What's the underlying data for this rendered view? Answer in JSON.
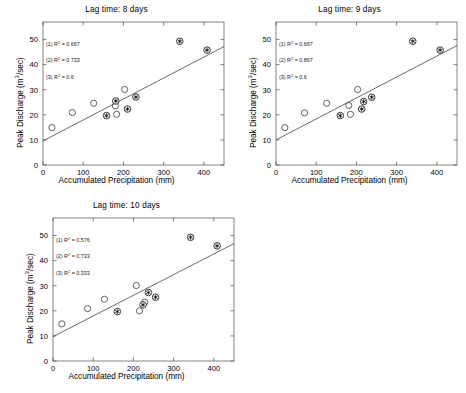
{
  "figure": {
    "panel_count": 3,
    "marker_legend": {
      "open_circle": "open-circle-marker",
      "asterisk_circle": "asterisk-in-circle-marker"
    }
  },
  "chart_data": [
    {
      "type": "scatter",
      "title": "Lag time: 8 days",
      "xlabel": "Accumulated Precipitation (mm)",
      "ylabel": "Peak Discharge (m3/sec)",
      "ylabel_display": "Peak Discharge (m",
      "ylabel_sup": "3",
      "ylabel_tail": "/sec)",
      "xlim": [
        0,
        450
      ],
      "ylim": [
        0,
        57
      ],
      "xticks": [
        0,
        100,
        200,
        300,
        400
      ],
      "yticks": [
        0,
        10,
        20,
        30,
        40,
        50
      ],
      "grid": false,
      "legend_position": "none",
      "annotations": [
        {
          "label": "(1) R",
          "sup": "2",
          "value": " = 0.667"
        },
        {
          "label": "(2) R",
          "sup": "2",
          "value": " = 0.733"
        },
        {
          "label": "(3) R",
          "sup": "2",
          "value": " = 0.6"
        }
      ],
      "fit_line": {
        "x": [
          0,
          450
        ],
        "y": [
          9.6,
          47.2
        ]
      },
      "series": [
        {
          "name": "open-circle",
          "marker": "open_circle",
          "points": [
            [
              22,
              14.9
            ],
            [
              73,
              20.9
            ],
            [
              126,
              24.6
            ],
            [
              180,
              23.6
            ],
            [
              183,
              20.2
            ],
            [
              203,
              30.1
            ]
          ]
        },
        {
          "name": "asterisk-circle",
          "marker": "asterisk_circle",
          "points": [
            [
              158,
              19.7
            ],
            [
              181,
              25.5
            ],
            [
              210,
              22.3
            ],
            [
              231,
              27.1
            ],
            [
              340,
              49.3
            ],
            [
              408,
              45.8
            ]
          ]
        }
      ]
    },
    {
      "type": "scatter",
      "title": "Lag time: 9 days",
      "xlabel": "Accumulated Precipitation (mm)",
      "ylabel": "Peak Discharge (m3/sec)",
      "ylabel_display": "Peak Discharge (m",
      "ylabel_sup": "3",
      "ylabel_tail": "/sec)",
      "xlim": [
        0,
        450
      ],
      "ylim": [
        0,
        57
      ],
      "xticks": [
        0,
        100,
        200,
        300,
        400
      ],
      "yticks": [
        0,
        10,
        20,
        30,
        40,
        50
      ],
      "grid": false,
      "legend_position": "none",
      "annotations": [
        {
          "label": "(1) R",
          "sup": "2",
          "value": " = 0.667"
        },
        {
          "label": "(2) R",
          "sup": "2",
          "value": " = 0.867"
        },
        {
          "label": "(3) R",
          "sup": "2",
          "value": " = 0.6"
        }
      ],
      "fit_line": {
        "x": [
          0,
          450
        ],
        "y": [
          10.0,
          47.6
        ]
      },
      "series": [
        {
          "name": "open-circle",
          "marker": "open_circle",
          "points": [
            [
              22,
              14.9
            ],
            [
              71,
              20.8
            ],
            [
              126,
              24.6
            ],
            [
              181,
              23.7
            ],
            [
              185,
              20.2
            ],
            [
              203,
              30.1
            ]
          ]
        },
        {
          "name": "asterisk-circle",
          "marker": "asterisk_circle",
          "points": [
            [
              160,
              19.7
            ],
            [
              213,
              22.3
            ],
            [
              218,
              25.3
            ],
            [
              238,
              27.0
            ],
            [
              340,
              49.3
            ],
            [
              408,
              45.8
            ]
          ]
        }
      ]
    },
    {
      "type": "scatter",
      "title": "Lag time: 10 days",
      "xlabel": "Accumulated Precipitation (mm)",
      "ylabel": "Peak Discharge (m3/sec)",
      "ylabel_display": "Peak Discharge (m",
      "ylabel_sup": "3",
      "ylabel_tail": "/sec)",
      "xlim": [
        0,
        450
      ],
      "ylim": [
        0,
        57
      ],
      "xticks": [
        0,
        100,
        200,
        300,
        400
      ],
      "yticks": [
        0,
        10,
        20,
        30,
        40,
        50
      ],
      "grid": false,
      "legend_position": "none",
      "annotations": [
        {
          "label": "(1) R",
          "sup": "2",
          "value": " = 0.576"
        },
        {
          "label": "(2) R",
          "sup": "2",
          "value": " = 0.733"
        },
        {
          "label": "(3) R",
          "sup": "2",
          "value": " = 0.333"
        }
      ],
      "fit_line": {
        "x": [
          0,
          450
        ],
        "y": [
          9.7,
          46.8
        ]
      },
      "series": [
        {
          "name": "open-circle",
          "marker": "open_circle",
          "points": [
            [
              22,
              14.8
            ],
            [
              86,
              20.9
            ],
            [
              128,
              24.6
            ],
            [
              207,
              30.1
            ],
            [
              215,
              20.0
            ],
            [
              228,
              23.4
            ]
          ]
        },
        {
          "name": "asterisk-circle",
          "marker": "asterisk_circle",
          "points": [
            [
              160,
              19.7
            ],
            [
              224,
              22.4
            ],
            [
              237,
              27.3
            ],
            [
              255,
              25.4
            ],
            [
              342,
              49.3
            ],
            [
              408,
              45.9
            ]
          ]
        }
      ]
    }
  ]
}
